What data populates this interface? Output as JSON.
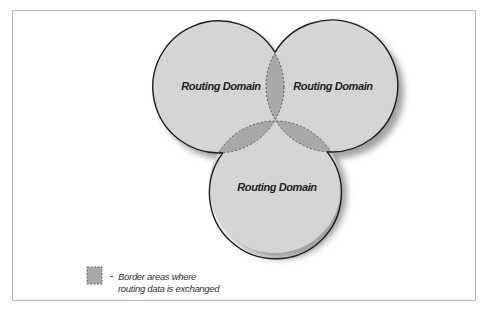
{
  "diagram": {
    "domains": [
      {
        "label": "Routing Domain",
        "cx": 218,
        "cy": 87,
        "r": 66
      },
      {
        "label": "Routing Domain",
        "cx": 332,
        "cy": 86,
        "r": 66
      },
      {
        "label": "Routing Domain",
        "cx": 275,
        "cy": 187,
        "r": 66
      }
    ],
    "colors": {
      "domain_fill": "#d5d5d5",
      "border_area_fill": "#a9a9a9",
      "outline": "#1e1e1e",
      "frame": "#b9b9b9"
    }
  },
  "legend": {
    "dash": "-",
    "line1": "Border areas where",
    "line2": "routing data is exchanged"
  }
}
